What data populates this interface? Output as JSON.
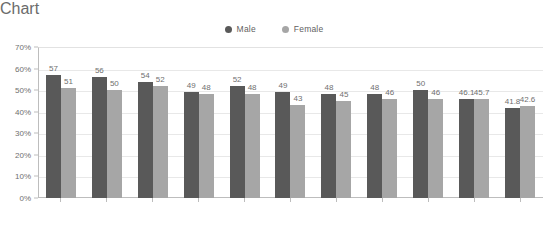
{
  "chart_data": {
    "type": "bar",
    "title": "",
    "xlabel": "",
    "ylabel": "",
    "ylim": [
      0,
      70
    ],
    "ytick_step": 10,
    "ytick_suffix": "%",
    "grid": true,
    "legend_position": "top-center",
    "categories": [
      "1991",
      "1993",
      "1995",
      "1997",
      "1999",
      "2001",
      "2003",
      "2005",
      "2007",
      "2009",
      "2010"
    ],
    "yticks": [
      "0%",
      "10%",
      "20%",
      "30%",
      "40%",
      "50%",
      "60%",
      "70%"
    ],
    "series": [
      {
        "name": "Male",
        "color": "#595959",
        "values": [
          57,
          56,
          54,
          49,
          52,
          49,
          48,
          48,
          50,
          46.1,
          41.8
        ],
        "labels": [
          "57",
          "56",
          "54",
          "49",
          "52",
          "49",
          "48",
          "48",
          "50",
          "46.1",
          "41.8"
        ]
      },
      {
        "name": "Female",
        "color": "#a6a6a6",
        "values": [
          51,
          50,
          52,
          48,
          48,
          43,
          45,
          46,
          46,
          45.7,
          42.6
        ],
        "labels": [
          "51",
          "50",
          "52",
          "48",
          "48",
          "43",
          "45",
          "46",
          "46",
          "45.7",
          "42.6"
        ]
      }
    ]
  },
  "legend": {
    "items": [
      {
        "label": "Male",
        "color": "#595959",
        "icon": "legend-dot-icon"
      },
      {
        "label": "Female",
        "color": "#a6a6a6",
        "icon": "legend-dot-icon"
      }
    ]
  }
}
